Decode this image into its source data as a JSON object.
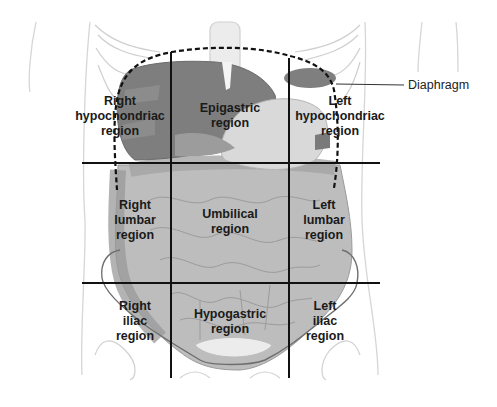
{
  "diagram": {
    "regions": [
      {
        "id": "right-hypochondriac",
        "lines": [
          "Right",
          "hypochondriac",
          "region"
        ],
        "x": 120,
        "y": 94
      },
      {
        "id": "epigastric",
        "lines": [
          "Epigastric",
          "region"
        ],
        "x": 230,
        "y": 101
      },
      {
        "id": "left-hypochondriac",
        "lines": [
          "Left",
          "hypochondriac",
          "region"
        ],
        "x": 340,
        "y": 94
      },
      {
        "id": "right-lumbar",
        "lines": [
          "Right",
          "lumbar",
          "region"
        ],
        "x": 135,
        "y": 198
      },
      {
        "id": "umbilical",
        "lines": [
          "Umbilical",
          "region"
        ],
        "x": 230,
        "y": 207
      },
      {
        "id": "left-lumbar",
        "lines": [
          "Left",
          "lumbar",
          "region"
        ],
        "x": 324,
        "y": 198
      },
      {
        "id": "right-iliac",
        "lines": [
          "Right",
          "iliac",
          "region"
        ],
        "x": 135,
        "y": 299
      },
      {
        "id": "hypogastric",
        "lines": [
          "Hypogastric",
          "region"
        ],
        "x": 230,
        "y": 307
      },
      {
        "id": "left-iliac",
        "lines": [
          "Left",
          "iliac",
          "region"
        ],
        "x": 325,
        "y": 299
      }
    ],
    "callout": {
      "label": "Diaphragm",
      "x": 408,
      "y": 78
    },
    "grid": {
      "vertical_x": [
        171,
        289
      ],
      "horizontal_y": [
        163,
        283
      ],
      "x_range": [
        82,
        380
      ],
      "y_range": [
        52,
        378
      ]
    },
    "colors": {
      "line": "#111111",
      "organ_dark": "#7a7a7a",
      "organ_mid": "#a9a9a9",
      "organ_light": "#d0d0d0",
      "outline": "#c8c8c8"
    }
  }
}
